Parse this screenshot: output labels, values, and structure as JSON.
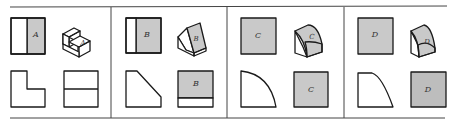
{
  "figure": {
    "panels": [
      {
        "id": "A",
        "face_label": "A"
      },
      {
        "id": "B",
        "face_label": "B"
      },
      {
        "id": "C",
        "face_label": "C"
      },
      {
        "id": "D",
        "face_label": "D"
      }
    ]
  },
  "colors": {
    "line": "#1a1a1a",
    "shade": "#c9c9c9",
    "background": "#ffffff"
  }
}
